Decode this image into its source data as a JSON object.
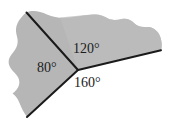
{
  "figure": {
    "colors": {
      "region_fill": "#b4b4b4",
      "region_fill_light": "#c2c2c2",
      "line_stroke": "#1a1a1a",
      "background": "#ffffff",
      "label_color": "#1c1c1c"
    },
    "vertex": {
      "name": "common-vertex",
      "x": 78,
      "y": 70
    },
    "rays": [
      {
        "name": "ray-upper-left",
        "from_x": 78,
        "from_y": 70,
        "to_x": 26,
        "to_y": 12
      },
      {
        "name": "ray-right",
        "from_x": 78,
        "from_y": 70,
        "to_x": 161,
        "to_y": 50
      },
      {
        "name": "ray-lower-left",
        "from_x": 78,
        "from_y": 70,
        "to_x": 27,
        "to_y": 117
      }
    ],
    "labels": {
      "angle_upper": "120°",
      "angle_left": "80°",
      "angle_lower": "160°"
    }
  }
}
